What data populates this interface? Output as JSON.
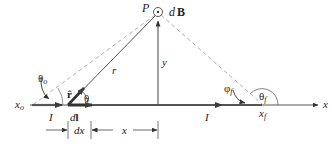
{
  "colors": {
    "axis": "#555555",
    "wire": "#4a4a4a",
    "dashed": "#a8a8a8",
    "text": "#222222",
    "background": "#ffffff"
  },
  "labels": {
    "point": "P",
    "field": "dB",
    "field_d": "d",
    "field_B": "B",
    "radius": "r",
    "perp_distance": "y",
    "unit_vector": "r̂",
    "theta": "θ",
    "theta_o": "θ",
    "theta_o_sub": "o",
    "theta_f": "θ",
    "theta_f_sub": "f",
    "phi_f": "φ",
    "phi_f_sub": "f",
    "x_o": "x",
    "x_o_sub": "o",
    "x_f": "x",
    "x_f_sub": "f",
    "x_axis": "x",
    "current_left": "I",
    "current_right": "I",
    "element": "dl",
    "element_d": "d",
    "element_l": "l",
    "dx": "dx",
    "x_dist": "x"
  },
  "geometry": {
    "axis_y": 105,
    "x_o": 33,
    "x_f": 262,
    "element_start": 68,
    "element_end": 92,
    "P": [
      158,
      12
    ]
  }
}
